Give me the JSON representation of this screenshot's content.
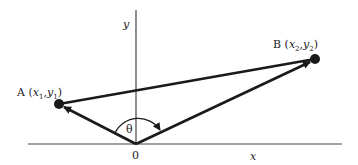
{
  "diagram": {
    "axis_labels": {
      "x": "x",
      "y": "y",
      "origin": "0"
    },
    "angle_label": "θ",
    "point_a": {
      "name": "A",
      "x_sym": "x",
      "x_sub": "1",
      "y_sym": "y",
      "y_sub": "1"
    },
    "point_b": {
      "name": "B",
      "x_sym": "x",
      "x_sub": "2",
      "y_sym": "y",
      "y_sub": "2"
    },
    "colors": {
      "ink": "#1a1a1a",
      "axis": "#444444"
    }
  }
}
